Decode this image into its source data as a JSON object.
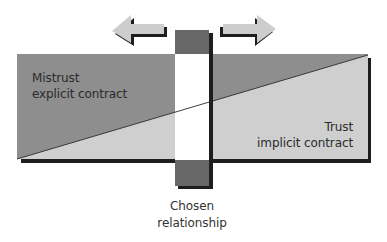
{
  "diagram": {
    "type": "trust-contract-continuum",
    "colors": {
      "background": "#ffffff",
      "mistrust_region": "#8e8e8e",
      "trust_region": "#cfcfcf",
      "chosen_block": "#686868",
      "chosen_window": "#ffffff",
      "arrow_fill": "#cdcdcd",
      "shadow": "#1e1e1e",
      "divider_line": "#2a2a2a",
      "text": "#2b2b2b"
    },
    "regions": {
      "upper_left": {
        "line1": "Mistrust",
        "line2": "explicit contract"
      },
      "lower_right": {
        "line1": "Trust",
        "line2": "implicit contract"
      }
    },
    "slider": {
      "label_line1": "Chosen",
      "label_line2": "relationship"
    },
    "arrows": {
      "left": "arrow-left",
      "right": "arrow-right"
    }
  }
}
